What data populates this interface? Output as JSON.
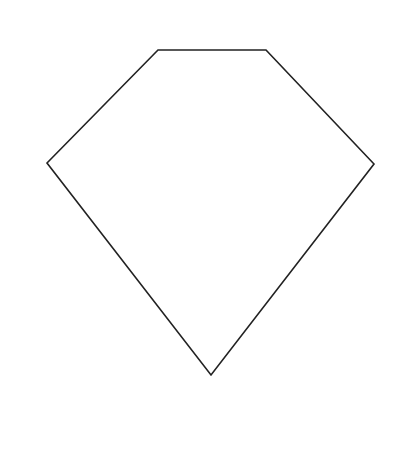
{
  "diagram": {
    "background": "#ffffff",
    "shape": {
      "type": "pentagon",
      "stroke": "#222222",
      "stroke_width": 1.6,
      "fill": "#ffffff",
      "points": "158,50 266,50 374,164 211,375 47,163"
    }
  }
}
